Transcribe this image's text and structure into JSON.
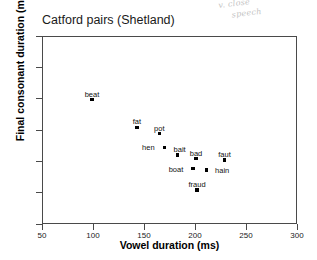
{
  "annotation": {
    "name": "handwritten-note",
    "line1": "v. close",
    "line2": "speech"
  },
  "chart_data": {
    "type": "scatter",
    "title": "Catford pairs (Shetland)",
    "xlabel": "Vowel duration (ms)",
    "ylabel": "Final consonant duration (ms)",
    "xlim": [
      50,
      300
    ],
    "ylim": [
      50,
      200
    ],
    "xticks": [
      50,
      100,
      150,
      200,
      250,
      300
    ],
    "yticks": [
      50,
      75,
      100,
      125,
      150,
      175,
      200
    ],
    "grid": false,
    "legend": null,
    "marker": "square",
    "marker_color": "#000000",
    "points": [
      {
        "label": "beat",
        "x": 98,
        "y": 150,
        "label_dx": 0,
        "label_dy": -10
      },
      {
        "label": "fat",
        "x": 142,
        "y": 128,
        "label_dx": 0,
        "label_dy": -10
      },
      {
        "label": "pot",
        "x": 164,
        "y": 123,
        "label_dx": 0,
        "label_dy": -10
      },
      {
        "label": "hen",
        "x": 169,
        "y": 112,
        "label_dx": -16,
        "label_dy": -4
      },
      {
        "label": "bait",
        "x": 182,
        "y": 106,
        "label_dx": 2,
        "label_dy": -10
      },
      {
        "label": "bad",
        "x": 200,
        "y": 103,
        "label_dx": 0,
        "label_dy": -10
      },
      {
        "label": "faut",
        "x": 228,
        "y": 102,
        "label_dx": 0,
        "label_dy": -10
      },
      {
        "label": "boat",
        "x": 197,
        "y": 95,
        "label_dx": -17,
        "label_dy": -4
      },
      {
        "label": "hain",
        "x": 210,
        "y": 94,
        "label_dx": 16,
        "label_dy": -4
      },
      {
        "label": "fraud",
        "x": 201,
        "y": 78,
        "label_dx": 0,
        "label_dy": -10
      }
    ]
  }
}
